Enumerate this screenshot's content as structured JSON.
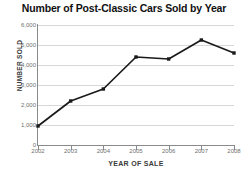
{
  "chart_data": {
    "type": "line",
    "title": "Number of Post-Classic Cars Sold by Year",
    "xlabel": "YEAR OF SALE",
    "ylabel": "NUMBER SOLD",
    "categories": [
      "2002",
      "2003",
      "2004",
      "2005",
      "2006",
      "2007",
      "2008"
    ],
    "x": [
      2002,
      2003,
      2004,
      2005,
      2006,
      2007,
      2008
    ],
    "values": [
      950,
      2200,
      2800,
      4400,
      4300,
      5250,
      4600
    ],
    "series": [
      {
        "name": "Number Sold",
        "values": [
          950,
          2200,
          2800,
          4400,
          4300,
          5250,
          4600
        ]
      }
    ],
    "ylim": [
      0,
      6000
    ],
    "xlim": [
      2002,
      2008
    ],
    "ytick_labels": [
      "0",
      "1,000",
      "2,000",
      "3,000",
      "4,000",
      "5,000",
      "6,000"
    ],
    "ytick_values": [
      0,
      1000,
      2000,
      3000,
      4000,
      5000,
      6000
    ],
    "xtick_labels": [
      "2002",
      "2003",
      "2004",
      "2005",
      "2006",
      "2007",
      "2008"
    ],
    "grid": "horizontal",
    "legend": "none",
    "line_color": "#1a1a1a",
    "marker": "square",
    "marker_color": "#1a1a1a",
    "gridline_color": "#d8d8d8",
    "axis_color": "#8a8a8a",
    "tick_label_color": "#6f6f6f",
    "title_color": "#111111"
  }
}
